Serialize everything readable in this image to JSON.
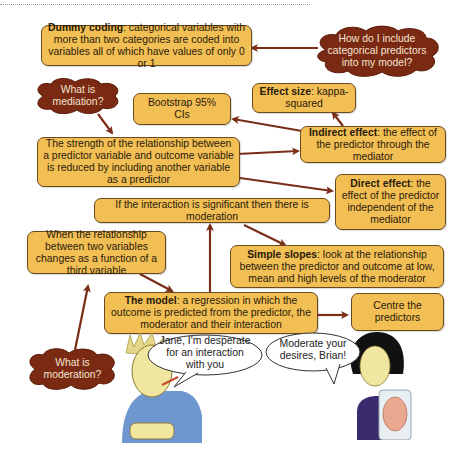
{
  "colors": {
    "box_fill": "#f2bf55",
    "box_border": "#6b4a1f",
    "cloud_fill": "#7a2a12",
    "arrow": "#7a2e18"
  },
  "boxes": {
    "dummy_coding": {
      "bold": "Dummy coding",
      "text": ": categorical variables with more than two categories are coded into variables all of which have values of only 0 or 1"
    },
    "bootstrap": {
      "text": "Bootstrap 95% CIs"
    },
    "effect_size": {
      "bold": "Effect size",
      "text": ": kappa-squared"
    },
    "indirect_effect": {
      "bold": "Indirect effect",
      "text": ": the effect of the predictor through the mediator"
    },
    "mediation_def": {
      "text": "The strength of the relationship between a predictor variable and outcome variable is reduced by including another variable as a predictor"
    },
    "direct_effect": {
      "bold": "Direct effect",
      "text": ": the effect of the predictor independent of the mediator"
    },
    "significant": {
      "text": "If the interaction is significant then there is moderation"
    },
    "moderation_def": {
      "text": "When the relationship between two variables changes as a function of a third variable"
    },
    "simple_slopes": {
      "bold": "Simple slopes",
      "text": ": look at the relationship between the predictor and outcome at low, mean and high levels of the moderator"
    },
    "the_model": {
      "bold": "The model",
      "text": ": a regression in which the outcome is predicted from the predictor, the moderator and their interaction"
    },
    "centre": {
      "text": "Centre the predictors"
    }
  },
  "clouds": {
    "categorical": "How do I include categorical predictors into my model?",
    "mediation": "What is mediation?",
    "moderation": "What is moderation?"
  },
  "speech": {
    "brian": "Jane, I'm desperate for an interaction with you",
    "jane": "Moderate your desires, Brian!"
  },
  "figures": {
    "brian": "Brian character",
    "jane": "Jane character holding brain in jar"
  }
}
